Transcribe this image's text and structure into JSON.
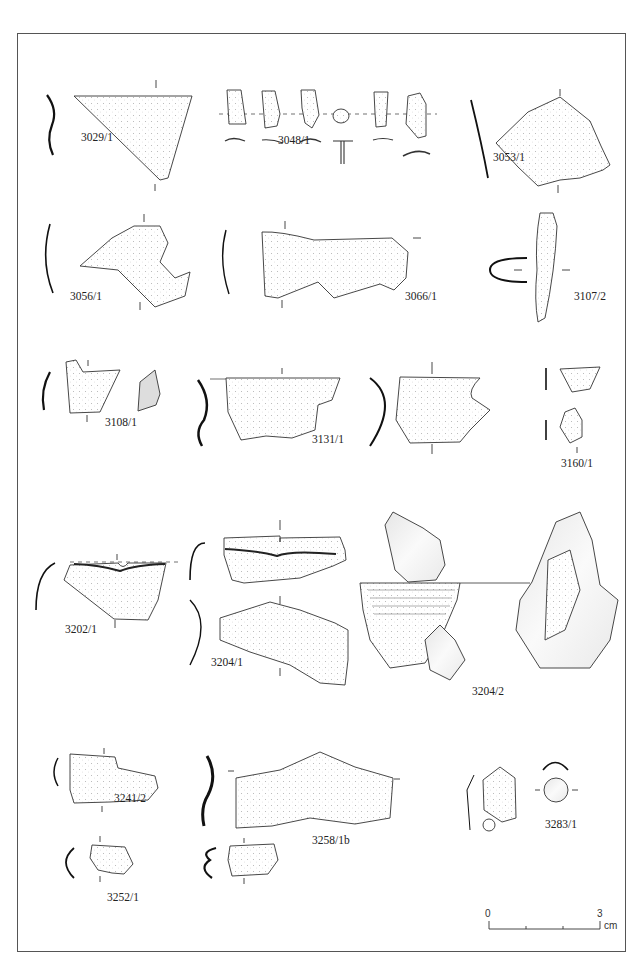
{
  "plate": {
    "specimens": [
      {
        "id": "3029/1",
        "x": 81,
        "y": 131
      },
      {
        "id": "3048/1",
        "x": 278,
        "y": 134
      },
      {
        "id": "3053/1",
        "x": 493,
        "y": 151
      },
      {
        "id": "3056/1",
        "x": 70,
        "y": 290
      },
      {
        "id": "3066/1",
        "x": 405,
        "y": 290
      },
      {
        "id": "3107/2",
        "x": 574,
        "y": 290
      },
      {
        "id": "3108/1",
        "x": 105,
        "y": 416
      },
      {
        "id": "3131/1",
        "x": 312,
        "y": 433
      },
      {
        "id": "3160/1",
        "x": 561,
        "y": 457
      },
      {
        "id": "3202/1",
        "x": 65,
        "y": 623
      },
      {
        "id": "3204/1",
        "x": 211,
        "y": 656
      },
      {
        "id": "3204/2",
        "x": 472,
        "y": 685
      },
      {
        "id": "3241/2",
        "x": 114,
        "y": 792
      },
      {
        "id": "3258/1b",
        "x": 312,
        "y": 834
      },
      {
        "id": "3283/1",
        "x": 545,
        "y": 818
      },
      {
        "id": "3252/1",
        "x": 107,
        "y": 891
      }
    ],
    "scale_bar": {
      "start_label": "0",
      "end_label": "3",
      "unit": "cm"
    }
  }
}
